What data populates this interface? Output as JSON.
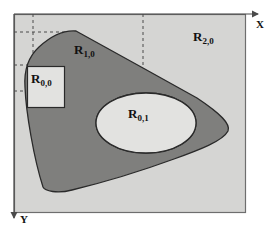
{
  "figure": {
    "background_color": "#ffffff",
    "frame": {
      "x": 14,
      "y": 14,
      "width": 232,
      "height": 199,
      "fill": "#d5d5d3",
      "stroke": "#6e6e6e"
    }
  },
  "axes": {
    "x_axis": {
      "label": "X",
      "direction": "right",
      "arrow_from_x": 14,
      "arrow_to_x": 262,
      "y": 14
    },
    "y_axis": {
      "label": "Y",
      "direction": "down",
      "arrow_from_y": 14,
      "arrow_to_y": 225,
      "x": 14
    }
  },
  "regions": [
    {
      "id": "R20",
      "label_base": "R",
      "label_sub": "2,0",
      "description": "outer background region",
      "fill": "#d5d5d3",
      "label_x": 193,
      "label_y": 34
    },
    {
      "id": "R10",
      "label_base": "R",
      "label_sub": "1,0",
      "description": "dark gray blob region",
      "fill": "#7f7f7d",
      "stroke": "#2a2a2a",
      "label_x": 76,
      "label_y": 46
    },
    {
      "id": "R01",
      "label_base": "R",
      "label_sub": "0,1",
      "description": "white ellipse hole inside blob",
      "fill": "#e2e2e0",
      "stroke": "#2a2a2a",
      "label_x": 130,
      "label_y": 110
    },
    {
      "id": "R00",
      "label_base": "R",
      "label_sub": "0,0",
      "description": "white rectangle inside blob",
      "fill": "#e2e2e0",
      "stroke": "#2a2a2a",
      "label_x": 35,
      "label_y": 74
    }
  ],
  "shapes": {
    "blob_path": "M 76,31 L 140,66 L 196,96 C 222,113 232,124 228,131 C 222,141 196,151 170,160 C 140,170 100,182 72,189 C 58,192 44,190 42,186 C 33,158 26,112 25,86 C 24,72 28,58 38,48 C 50,37 64,30 76,31 Z",
    "ellipse": {
      "cx": 146,
      "cy": 123,
      "rx": 50,
      "ry": 30
    },
    "rectangle": {
      "x": 27,
      "y": 66,
      "width": 37,
      "height": 41
    }
  },
  "grid": {
    "stroke": "#4a4a4a",
    "dash": "3,3",
    "vertical_lines": [
      {
        "x": 33,
        "y1": 14,
        "y2": 93
      },
      {
        "x": 143,
        "y1": 14,
        "y2": 93
      }
    ],
    "horizontal_lines": [
      {
        "y": 32,
        "x1": 14,
        "x2": 76
      },
      {
        "y": 65,
        "x1": 14,
        "x2": 33
      },
      {
        "y": 91,
        "x1": 14,
        "x2": 143
      }
    ]
  }
}
